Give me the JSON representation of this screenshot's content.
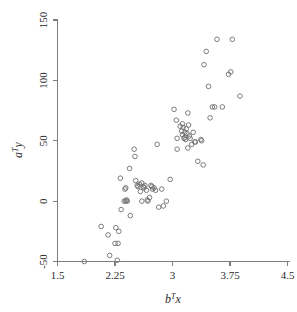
{
  "chart_data": {
    "type": "scatter",
    "title": "",
    "xlabel": "b^T x",
    "ylabel": "a^T y",
    "xlabel_parts": {
      "base": "b",
      "sup": "T",
      "var": "x"
    },
    "ylabel_parts": {
      "base": "a",
      "sup": "T",
      "var": "y"
    },
    "xlim": [
      1.5,
      4.5
    ],
    "ylim": [
      -50,
      150
    ],
    "xticks": [
      1.5,
      2.25,
      3,
      3.75,
      4.5
    ],
    "xtick_labels": [
      "1.5",
      "2.25",
      "3",
      "3.75",
      "4.5"
    ],
    "yticks": [
      -50,
      0,
      50,
      100,
      150
    ],
    "ytick_labels": [
      "-50",
      "0",
      "50",
      "100",
      "150"
    ],
    "grid": false,
    "legend": null,
    "marker": {
      "shape": "open-circle",
      "radius": 2.3,
      "stroke": "#6e6e6e",
      "fill": "none"
    },
    "n_points": 86,
    "points": [
      [
        1.85,
        -50
      ],
      [
        2.07,
        -21
      ],
      [
        2.16,
        -28
      ],
      [
        2.18,
        -45
      ],
      [
        2.26,
        -22
      ],
      [
        2.25,
        -35
      ],
      [
        2.29,
        -35
      ],
      [
        2.3,
        -25
      ],
      [
        2.28,
        -49
      ],
      [
        2.32,
        19
      ],
      [
        2.33,
        -7
      ],
      [
        2.38,
        10
      ],
      [
        2.39,
        11
      ],
      [
        2.37,
        0
      ],
      [
        2.39,
        0
      ],
      [
        2.4,
        1
      ],
      [
        2.41,
        0
      ],
      [
        2.44,
        27
      ],
      [
        2.45,
        -12
      ],
      [
        2.5,
        43
      ],
      [
        2.51,
        37
      ],
      [
        2.52,
        17
      ],
      [
        2.54,
        13
      ],
      [
        2.55,
        12
      ],
      [
        2.57,
        14
      ],
      [
        2.58,
        8
      ],
      [
        2.6,
        15
      ],
      [
        2.62,
        12
      ],
      [
        2.63,
        11
      ],
      [
        2.64,
        13
      ],
      [
        2.66,
        9
      ],
      [
        2.67,
        1
      ],
      [
        2.68,
        0
      ],
      [
        2.7,
        3
      ],
      [
        2.72,
        13
      ],
      [
        2.73,
        12
      ],
      [
        2.74,
        10
      ],
      [
        2.76,
        11
      ],
      [
        2.78,
        9
      ],
      [
        2.8,
        47
      ],
      [
        2.82,
        -5
      ],
      [
        2.86,
        10
      ],
      [
        2.88,
        -4
      ],
      [
        2.97,
        18
      ],
      [
        3.02,
        76
      ],
      [
        3.05,
        67
      ],
      [
        3.06,
        43
      ],
      [
        3.1,
        62
      ],
      [
        3.12,
        58
      ],
      [
        3.13,
        55
      ],
      [
        3.14,
        61
      ],
      [
        3.15,
        52
      ],
      [
        3.16,
        53
      ],
      [
        3.16,
        57
      ],
      [
        3.17,
        51
      ],
      [
        3.18,
        60
      ],
      [
        3.19,
        56
      ],
      [
        3.2,
        73
      ],
      [
        3.21,
        63
      ],
      [
        3.22,
        54
      ],
      [
        3.23,
        52
      ],
      [
        3.25,
        47
      ],
      [
        3.27,
        57
      ],
      [
        3.29,
        49
      ],
      [
        3.3,
        49
      ],
      [
        3.33,
        33
      ],
      [
        3.37,
        51
      ],
      [
        3.38,
        50
      ],
      [
        3.4,
        30
      ],
      [
        3.41,
        113
      ],
      [
        3.44,
        124
      ],
      [
        3.47,
        95
      ],
      [
        3.49,
        69
      ],
      [
        3.52,
        78
      ],
      [
        3.55,
        78
      ],
      [
        3.58,
        134
      ],
      [
        3.65,
        78
      ],
      [
        3.73,
        105
      ],
      [
        3.76,
        107
      ],
      [
        3.78,
        134
      ],
      [
        3.88,
        87
      ],
      [
        2.92,
        0
      ],
      [
        2.6,
        0
      ],
      [
        3.06,
        52
      ],
      [
        3.13,
        64
      ],
      [
        3.2,
        44
      ]
    ]
  },
  "axes": {
    "x_axis_name": "horizontal-axis",
    "y_axis_name": "vertical-axis"
  }
}
